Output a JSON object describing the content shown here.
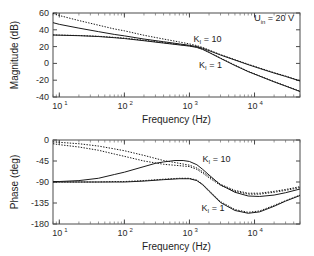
{
  "figure": {
    "background": "#ffffff",
    "foreground": "#1a1a1a"
  },
  "chart_data": [
    {
      "type": "line",
      "id": "magnitude",
      "title": "",
      "xlabel": "Frequency (Hz)",
      "ylabel": "Magnitude (dB)",
      "xscale": "log",
      "xlim": [
        8,
        50000
      ],
      "ylim": [
        -40,
        60
      ],
      "yticks": [
        -40,
        -20,
        0,
        20,
        40,
        60
      ],
      "ytick_labels": [
        "-40",
        "-20",
        "0",
        "20",
        "40",
        "60"
      ],
      "xticks": [
        10,
        100,
        1000,
        10000
      ],
      "xtick_labels": [
        "10",
        "10",
        "10",
        "10"
      ],
      "xtick_exponents": [
        "1",
        "2",
        "3",
        "4"
      ],
      "grid": false,
      "annotations": [
        {
          "text": "U",
          "sub": "in",
          "rest": " = 20 V",
          "x": 20000,
          "y": 50
        },
        {
          "text": "K",
          "sub": "I",
          "rest": " = 10",
          "x": 1900,
          "y": 26
        },
        {
          "text": "K",
          "sub": "I",
          "rest": " = 1",
          "x": 2100,
          "y": -5
        }
      ],
      "series": [
        {
          "name": "K_I = 10 solid",
          "style": "solid",
          "x": [
            8,
            10,
            20,
            40,
            70,
            100,
            200,
            400,
            700,
            1000,
            1300,
            1600,
            2000,
            3000,
            5000,
            8000,
            12000,
            20000,
            30000,
            50000
          ],
          "values": [
            48.5,
            46.5,
            42.0,
            37.8,
            34.5,
            32.8,
            29.0,
            25.8,
            23.2,
            21.5,
            20.0,
            18.0,
            15.2,
            10.0,
            4.0,
            -1.5,
            -6.0,
            -11.5,
            -15.5,
            -21.0
          ]
        },
        {
          "name": "K_I = 10 dotted",
          "style": "dotted",
          "x": [
            8,
            10,
            20,
            40,
            70,
            100,
            200,
            400,
            700,
            1000,
            1300,
            1600,
            2000,
            3000,
            5000,
            8000,
            12000,
            20000,
            30000,
            50000
          ],
          "values": [
            59.5,
            57.0,
            51.0,
            45.5,
            41.0,
            38.8,
            33.5,
            29.0,
            25.5,
            23.2,
            21.2,
            19.0,
            16.0,
            10.5,
            4.5,
            -1.0,
            -5.5,
            -11.0,
            -15.0,
            -20.5
          ]
        },
        {
          "name": "K_I = 1 solid",
          "style": "solid",
          "x": [
            8,
            10,
            20,
            40,
            70,
            100,
            200,
            400,
            700,
            1000,
            1300,
            1600,
            2000,
            3000,
            5000,
            8000,
            12000,
            20000,
            30000,
            50000
          ],
          "values": [
            33.8,
            33.6,
            33.0,
            32.0,
            30.6,
            29.6,
            27.0,
            24.2,
            22.0,
            20.6,
            19.0,
            16.6,
            13.0,
            6.0,
            -2.5,
            -9.8,
            -15.2,
            -22.0,
            -27.0,
            -33.5
          ]
        },
        {
          "name": "K_I = 1 dotted",
          "style": "dotted",
          "x": [
            8,
            10,
            20,
            40,
            70,
            100,
            200,
            400,
            700,
            1000,
            1300,
            1600,
            2000,
            3000,
            5000,
            8000,
            12000,
            20000,
            30000,
            50000
          ],
          "values": [
            33.9,
            33.7,
            33.2,
            32.3,
            31.0,
            30.1,
            27.6,
            24.8,
            22.4,
            21.0,
            19.4,
            17.0,
            13.4,
            6.4,
            -2.0,
            -9.4,
            -14.8,
            -21.6,
            -26.6,
            -33.0
          ]
        }
      ]
    },
    {
      "type": "line",
      "id": "phase",
      "title": "",
      "xlabel": "Frequency (Hz)",
      "ylabel": "Phase (deg)",
      "xscale": "log",
      "xlim": [
        8,
        50000
      ],
      "ylim": [
        -180,
        0
      ],
      "yticks": [
        -180,
        -135,
        -90,
        -45,
        0
      ],
      "ytick_labels": [
        "-180",
        "-135",
        "-90",
        "-45",
        "0"
      ],
      "xticks": [
        10,
        100,
        1000,
        10000
      ],
      "xtick_labels": [
        "10",
        "10",
        "10",
        "10"
      ],
      "xtick_exponents": [
        "1",
        "2",
        "3",
        "4"
      ],
      "grid": false,
      "annotations": [
        {
          "text": "K",
          "sub": "I",
          "rest": " = 10",
          "x": 2600,
          "y": -47
        },
        {
          "text": "K",
          "sub": "I",
          "rest": " = 1",
          "x": 2300,
          "y": -152
        }
      ],
      "series": [
        {
          "name": "K_I = 10 dotted upper",
          "style": "dotted",
          "x": [
            8,
            10,
            20,
            40,
            70,
            100,
            200,
            400,
            700,
            1000,
            1300,
            1600,
            2000,
            3000,
            5000,
            8000,
            12000,
            20000,
            30000,
            50000
          ],
          "values": [
            -4,
            -5,
            -8,
            -13,
            -19,
            -23,
            -33,
            -44,
            -50,
            -54,
            -60,
            -68,
            -78,
            -95,
            -108,
            -114,
            -114,
            -110,
            -106,
            -100
          ]
        },
        {
          "name": "K_I = 10 dotted lower",
          "style": "dotted",
          "x": [
            8,
            10,
            20,
            40,
            70,
            100,
            200,
            400,
            700,
            1000,
            1300,
            1600,
            2000,
            3000,
            5000,
            8000,
            12000,
            20000,
            30000,
            50000
          ],
          "values": [
            -8,
            -10,
            -15,
            -22,
            -30,
            -35,
            -45,
            -52,
            -55,
            -57,
            -63,
            -71,
            -81,
            -97,
            -110,
            -116,
            -116,
            -112,
            -108,
            -102
          ]
        },
        {
          "name": "K_I = 1 solid rising",
          "style": "solid",
          "x": [
            8,
            10,
            20,
            40,
            70,
            100,
            200,
            300,
            400,
            600,
            800,
            1000,
            1300,
            1600,
            2000,
            3000,
            5000,
            8000,
            12000,
            20000,
            30000,
            50000
          ],
          "values": [
            -89,
            -89,
            -87,
            -82,
            -74,
            -69,
            -57,
            -50,
            -47,
            -44,
            -44,
            -46,
            -53,
            -63,
            -75,
            -96,
            -112,
            -120,
            -121,
            -118,
            -113,
            -105
          ]
        },
        {
          "name": "K_I = 1 dotted flat",
          "style": "dotted",
          "x": [
            8,
            10,
            20,
            40,
            70,
            100,
            200,
            400,
            700,
            1000,
            1300,
            1600,
            2000,
            3000,
            5000,
            8000,
            12000,
            20000,
            30000,
            50000
          ],
          "values": [
            -90,
            -90,
            -90,
            -90,
            -89,
            -89,
            -87,
            -84,
            -82,
            -82,
            -86,
            -95,
            -108,
            -132,
            -149,
            -155,
            -152,
            -140,
            -130,
            -118
          ]
        },
        {
          "name": "K_I = 1 solid dip",
          "style": "solid",
          "x": [
            8,
            10,
            20,
            40,
            70,
            100,
            200,
            400,
            700,
            1000,
            1300,
            1600,
            2000,
            3000,
            5000,
            8000,
            12000,
            20000,
            30000,
            50000
          ],
          "values": [
            -90,
            -90,
            -90,
            -90,
            -90,
            -90,
            -88,
            -85,
            -83,
            -83,
            -87,
            -96,
            -110,
            -134,
            -151,
            -157,
            -154,
            -142,
            -131,
            -119
          ]
        }
      ]
    }
  ]
}
